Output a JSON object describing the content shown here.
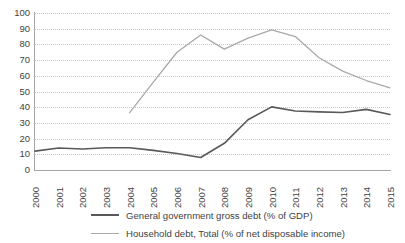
{
  "chart_data": {
    "type": "line",
    "title": "",
    "xlabel": "",
    "ylabel": "",
    "ylim": [
      0,
      100
    ],
    "ytick_step": 10,
    "yticks": [
      "100",
      "90",
      "80",
      "70",
      "60",
      "50",
      "40",
      "30",
      "20",
      "10",
      "0"
    ],
    "grid": true,
    "legend_position": "bottom",
    "categories": [
      "2000",
      "2001",
      "2002",
      "2003",
      "2004",
      "2005",
      "2006",
      "2007",
      "2008",
      "2009",
      "2010",
      "2011",
      "2012",
      "2013",
      "2014",
      "2015"
    ],
    "series": [
      {
        "name": "General government gross debt (% of GDP)",
        "color": "#595959",
        "values": [
          12,
          14,
          13.4,
          14.2,
          14.2,
          12.5,
          10.5,
          8,
          17,
          32,
          40.2,
          37.6,
          37,
          36.6,
          38.6,
          35.4
        ]
      },
      {
        "name": "Household debt, Total (% of net disposable income)",
        "color": "#a9a9a9",
        "values": [
          null,
          null,
          null,
          null,
          36.5,
          56,
          75,
          86,
          77,
          84,
          89.3,
          85,
          71.5,
          63,
          57,
          52.3
        ]
      }
    ]
  },
  "legend": {
    "items": [
      {
        "label": "General government gross debt (% of GDP)"
      },
      {
        "label": "Household debt, Total (% of net disposable income)"
      }
    ]
  }
}
